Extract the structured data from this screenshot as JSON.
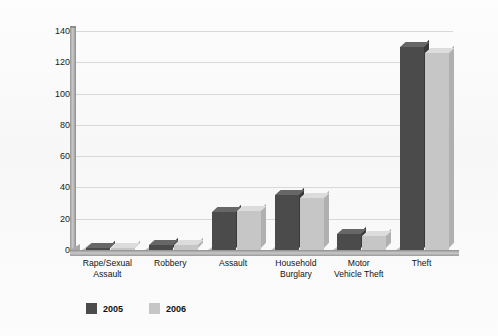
{
  "chart_data": {
    "type": "bar",
    "title": "",
    "xlabel": "",
    "ylabel": "Victimization Rate per 1000 Households",
    "ylim": [
      0,
      140
    ],
    "ytick_step": 20,
    "yticks": [
      140,
      120,
      100,
      80,
      60,
      40,
      20,
      0
    ],
    "grid": true,
    "legend_position": "bottom-left",
    "categories": [
      "Rape/Sexual\nAssault",
      "Robbery",
      "Assault",
      "Household\nBurglary",
      "Motor\nVehicle Theft",
      "Theft"
    ],
    "series": [
      {
        "name": "2005",
        "color": "#4b4b4b",
        "values": [
          1,
          3,
          24,
          35,
          10,
          130
        ]
      },
      {
        "name": "2006",
        "color": "#c6c6c6",
        "values": [
          1,
          3,
          25,
          33,
          9,
          126
        ]
      }
    ]
  },
  "legend": {
    "items": [
      {
        "label": "2005",
        "color": "#4b4b4b"
      },
      {
        "label": "2006",
        "color": "#c6c6c6"
      }
    ]
  }
}
